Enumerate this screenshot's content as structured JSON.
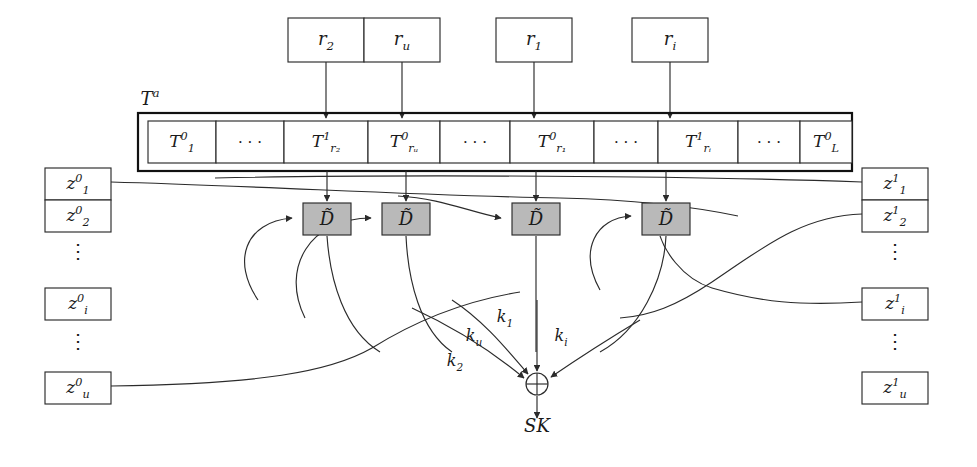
{
  "figure": {
    "array_label": "T",
    "array_label_sup": "a",
    "output_label": "SK",
    "xor_symbol": "⊕",
    "colors": {
      "stroke": "#2b2b2b",
      "outer_stroke": "#111111",
      "d_box_fill": "#b9b9b9",
      "box_fill": "#ffffff",
      "background": "#ffffff"
    }
  },
  "top_inputs": [
    {
      "name": "r-2-box",
      "base": "r",
      "sub": "2",
      "x": 288,
      "y": 18,
      "w": 76,
      "h": 44,
      "arrow_x": 326
    },
    {
      "name": "r-u-box",
      "base": "r",
      "sub": "u",
      "x": 364,
      "y": 18,
      "w": 76,
      "h": 44,
      "arrow_x": 402
    },
    {
      "name": "r-1-box",
      "base": "r",
      "sub": "1",
      "x": 496,
      "y": 18,
      "w": 76,
      "h": 44,
      "arrow_x": 534
    },
    {
      "name": "r-i-box",
      "base": "r",
      "sub": "i",
      "x": 632,
      "y": 18,
      "w": 76,
      "h": 44,
      "arrow_x": 670
    }
  ],
  "table_array": {
    "outer": {
      "x": 138,
      "y": 113,
      "w": 714,
      "h": 58
    },
    "inner": {
      "x": 148,
      "y": 121,
      "y2": 163
    },
    "cells": [
      {
        "name": "cell-T-1",
        "kind": "math",
        "base": "T",
        "sup": "0",
        "sub": "1",
        "x": 148,
        "w": 68
      },
      {
        "name": "cell-ellipsis-1",
        "kind": "dots",
        "text": "· · ·",
        "x": 216,
        "w": 68
      },
      {
        "name": "cell-T-r2",
        "kind": "math",
        "base": "T",
        "sup": "1",
        "sub": "r₂",
        "x": 284,
        "w": 84
      },
      {
        "name": "cell-T-ru",
        "kind": "math",
        "base": "T",
        "sup": "0",
        "sub": "rᵤ",
        "x": 368,
        "w": 72
      },
      {
        "name": "cell-ellipsis-2",
        "kind": "dots",
        "text": "· · ·",
        "x": 440,
        "w": 70
      },
      {
        "name": "cell-T-r1",
        "kind": "math",
        "base": "T",
        "sup": "0",
        "sub": "r₁",
        "x": 510,
        "w": 84
      },
      {
        "name": "cell-ellipsis-3",
        "kind": "dots",
        "text": "· · ·",
        "x": 594,
        "w": 64
      },
      {
        "name": "cell-T-ri",
        "kind": "math",
        "base": "T",
        "sup": "1",
        "sub": "rᵢ",
        "x": 658,
        "w": 80
      },
      {
        "name": "cell-ellipsis-4",
        "kind": "dots",
        "text": "· · ·",
        "x": 738,
        "w": 62
      },
      {
        "name": "cell-T-L",
        "kind": "math",
        "base": "T",
        "sup": "0",
        "sub": "L",
        "x": 800,
        "w": 52
      }
    ]
  },
  "d_boxes": [
    {
      "name": "d-box-1",
      "label": "D̃",
      "x": 303,
      "y": 203,
      "w": 48,
      "h": 32
    },
    {
      "name": "d-box-2",
      "label": "D̃",
      "x": 382,
      "y": 203,
      "w": 48,
      "h": 32
    },
    {
      "name": "d-box-3",
      "label": "D̃",
      "x": 512,
      "y": 203,
      "w": 48,
      "h": 32
    },
    {
      "name": "d-box-4",
      "label": "D̃",
      "x": 642,
      "y": 203,
      "w": 48,
      "h": 32
    }
  ],
  "left_column": {
    "x": 45,
    "w": 66,
    "h": 32,
    "items": [
      {
        "name": "z0-1-box",
        "kind": "box",
        "base": "z",
        "sup": "0",
        "sub": "1",
        "y": 168
      },
      {
        "name": "z0-2-box",
        "kind": "box",
        "base": "z",
        "sup": "0",
        "sub": "2",
        "y": 200
      },
      {
        "name": "left-vdots-1",
        "kind": "vdots",
        "text": "⋮",
        "y": 248
      },
      {
        "name": "z0-i-box",
        "kind": "box",
        "base": "z",
        "sup": "0",
        "sub": "i",
        "y": 288
      },
      {
        "name": "left-vdots-2",
        "kind": "vdots",
        "text": "⋮",
        "y": 338
      },
      {
        "name": "z0-u-box",
        "kind": "box",
        "base": "z",
        "sup": "0",
        "sub": "u",
        "y": 372
      }
    ]
  },
  "right_column": {
    "x": 862,
    "w": 66,
    "h": 32,
    "items": [
      {
        "name": "z1-1-box",
        "kind": "box",
        "base": "z",
        "sup": "1",
        "sub": "1",
        "y": 168
      },
      {
        "name": "z1-2-box",
        "kind": "box",
        "base": "z",
        "sup": "1",
        "sub": "2",
        "y": 200
      },
      {
        "name": "right-vdots-1",
        "kind": "vdots",
        "text": "⋮",
        "y": 248
      },
      {
        "name": "z1-i-box",
        "kind": "box",
        "base": "z",
        "sup": "1",
        "sub": "i",
        "y": 288
      },
      {
        "name": "right-vdots-2",
        "kind": "vdots",
        "text": "⋮",
        "y": 338
      },
      {
        "name": "z1-u-box",
        "kind": "box",
        "base": "z",
        "sup": "1",
        "sub": "u",
        "y": 372
      }
    ]
  },
  "key_labels": [
    {
      "name": "key-label-k1",
      "base": "k",
      "sub": "1",
      "x": 505,
      "y": 322
    },
    {
      "name": "key-label-ku",
      "base": "k",
      "sub": "u",
      "x": 474,
      "y": 341
    },
    {
      "name": "key-label-k2",
      "base": "k",
      "sub": "2",
      "x": 455,
      "y": 366
    },
    {
      "name": "key-label-ki",
      "base": "k",
      "sub": "i",
      "x": 561,
      "y": 341
    }
  ],
  "xor_node": {
    "name": "xor-node",
    "cx": 537,
    "cy": 384,
    "r": 11
  },
  "output": {
    "name": "sk-output-label",
    "text": "SK",
    "x": 537,
    "y": 432
  }
}
